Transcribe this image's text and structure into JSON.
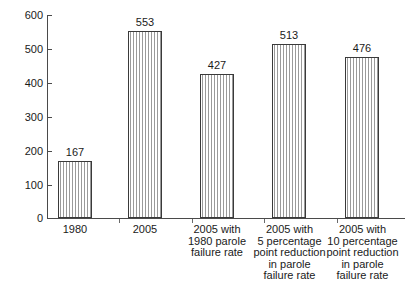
{
  "chart_data": {
    "type": "bar",
    "title": "",
    "subtitle": "",
    "xlabel": "",
    "ylabel": "",
    "ylim": [
      0,
      600
    ],
    "ytick_step": 100,
    "yticks": [
      "0",
      "100",
      "200",
      "300",
      "400",
      "500",
      "600"
    ],
    "grid": false,
    "legend": null,
    "categories": [
      "1980",
      "2005",
      "2005 with\n1980 parole\nfailure rate",
      "2005 with\n5 percentage\npoint reduction\nin parole\nfailure rate",
      "2005 with\n10 percentage\npoint reduction\nin parole\nfailure rate"
    ],
    "category_lines": [
      [
        "1980"
      ],
      [
        "2005"
      ],
      [
        "2005 with",
        "1980 parole",
        "failure rate"
      ],
      [
        "2005 with",
        "5 percentage",
        "point reduction",
        "in parole",
        "failure rate"
      ],
      [
        "2005 with",
        "10 percentage",
        "point reduction",
        "in parole",
        "failure rate"
      ]
    ],
    "values": [
      167,
      553,
      427,
      513,
      476
    ],
    "value_labels": [
      "167",
      "553",
      "427",
      "513",
      "476"
    ],
    "bar_style": "vertical-hatch",
    "colors": {
      "bar_outline": "#3a3a3a",
      "bar_hatch": "#9a9a9a",
      "bar_fill": "#ffffff",
      "axis": "#4a4a4a",
      "text": "#1a1a1a",
      "background": "#ffffff"
    }
  }
}
